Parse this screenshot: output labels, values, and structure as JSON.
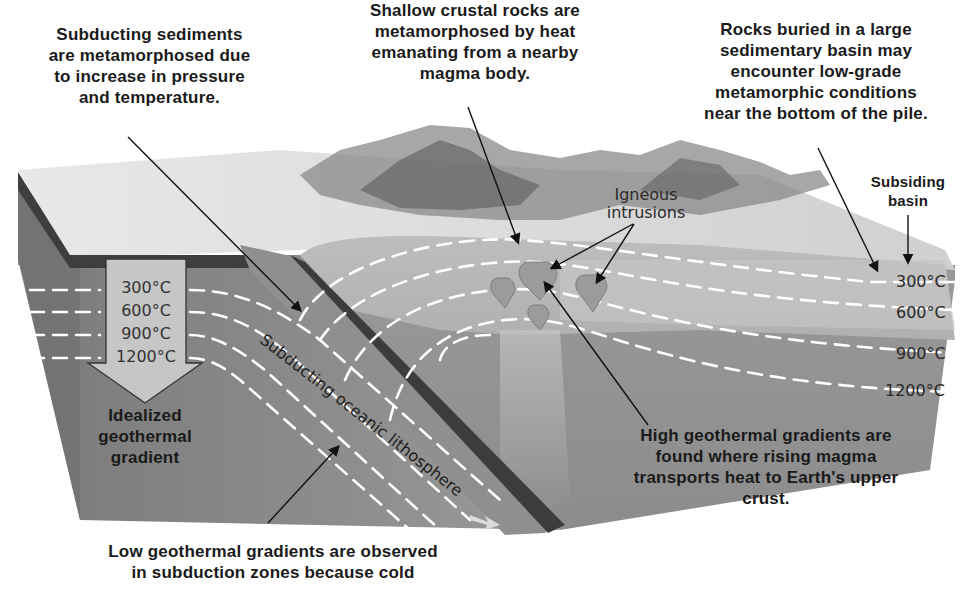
{
  "figure": {
    "callouts": {
      "subducting_sediments": [
        "Subducting sediments",
        "are metamorphosed due",
        "to increase in pressure",
        "and temperature."
      ],
      "shallow_crustal": [
        "Shallow crustal rocks are",
        "metamorphosed by heat",
        "emanating from a nearby",
        "magma body."
      ],
      "sedimentary_basin": [
        "Rocks buried in a large",
        "sedimentary basin may",
        "encounter low-grade",
        "metamorphic conditions",
        "near the bottom of the pile."
      ],
      "high_gradient": [
        "High geothermal gradients are",
        "found where rising magma",
        "transports heat to Earth's upper",
        "crust."
      ],
      "low_gradient": [
        "Low geothermal gradients are observed",
        "in subduction zones because cold"
      ],
      "idealized": [
        "Idealized",
        "geothermal",
        "gradient"
      ],
      "subsiding_basin": [
        "Subsiding",
        "basin"
      ]
    },
    "labels": {
      "igneous_intrusions": [
        "Igneous",
        "intrusions"
      ],
      "slab": "Subducting oceanic lithosphere"
    },
    "isotherms": {
      "arrow_temps": [
        "300°C",
        "600°C",
        "900°C",
        "1200°C"
      ],
      "right_temps": [
        "300°C",
        "600°C",
        "900°C",
        "1200°C"
      ]
    },
    "colors": {
      "text": "#1a1a1a",
      "surface_light": "#e6e6e6",
      "crust_mid": "#a9a9a9",
      "mantle_dark": "#8a8a8a",
      "slab_dark": "#4a4a4a",
      "isotherm": "#ffffff",
      "arrow_fill": "#c8c8c8"
    }
  }
}
